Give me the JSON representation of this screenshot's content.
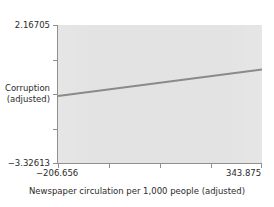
{
  "chart_data": {
    "type": "line",
    "title": "",
    "subtitle": "",
    "xlabel": "Newspaper circulation per 1,000 people (adjusted)",
    "ylabel": "Corruption (adjusted)",
    "ylabel_line1": "Corruption",
    "ylabel_line2": "(adjusted)",
    "xlim": [
      -206.656,
      343.875
    ],
    "ylim": [
      -3.32613,
      2.16705
    ],
    "grid": false,
    "legend": null,
    "x_tick_labels": [
      "−206.656",
      "343.875"
    ],
    "x_tick_values": [
      -206.656,
      343.875
    ],
    "y_tick_labels": [
      "2.16705",
      "Corruption\n(adjusted)",
      "−3.32613"
    ],
    "y_tick_values": [
      2.16705,
      -0.57954,
      -3.32613
    ],
    "y_top_label": "2.16705",
    "y_bottom_label": "−3.32613",
    "x_left_label": "−206.656",
    "x_right_label": "343.875",
    "n_x_ticks": 5,
    "n_y_ticks": 5,
    "series": [
      {
        "name": "fitted regression line",
        "type": "line",
        "x": [
          -206.656,
          343.875
        ],
        "y": [
          -0.6595,
          0.3915
        ],
        "color": "#8a8a8a",
        "width": 2
      }
    ],
    "plot_background": "#e3e3e3",
    "figure_background": "#ffffff",
    "axis_color": "#8f8f8f",
    "text_color": "#2b2b2b"
  },
  "axes": {
    "x_title": "Newspaper circulation per 1,000 people (adjusted)",
    "y_title_line1": "Corruption",
    "y_title_line2": "(adjusted)",
    "x_min_label": "−206.656",
    "x_max_label": "343.875",
    "y_max_label": "2.16705",
    "y_min_label": "−3.32613"
  }
}
